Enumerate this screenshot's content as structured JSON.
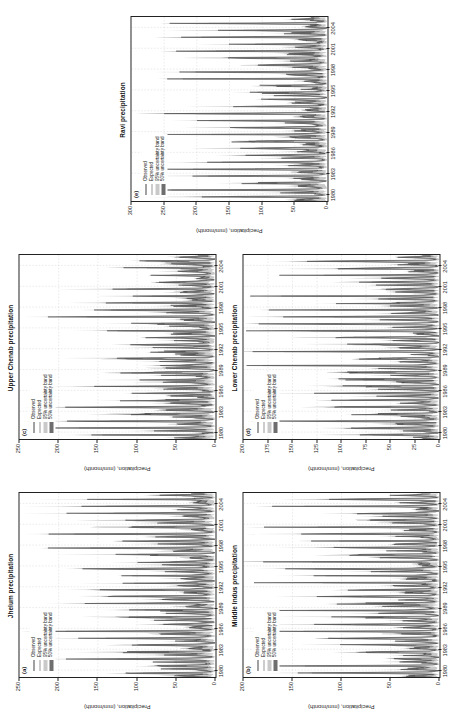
{
  "figure": {
    "axis_label": "Precipitation, (mm/month)",
    "legend": [
      {
        "key": "observed",
        "label": "Observed"
      },
      {
        "key": "expected",
        "label": "Expected"
      },
      {
        "key": "band95",
        "label": "95% uncertainty band"
      },
      {
        "key": "band50",
        "label": "50% uncertainty band"
      }
    ],
    "colors": {
      "observed": "#444444",
      "expected": "#9a9a9a",
      "band95": "#c9c9c9",
      "band50": "#6e6e6e",
      "axis": "#222222",
      "grid": "#cccccc"
    }
  },
  "chart_data": [
    {
      "type": "line",
      "tag": "(a)",
      "title": "Jhelum precipitation",
      "xlabel": "",
      "ylabel": "Precipitation, (mm/month)",
      "ylim": [
        0,
        250
      ],
      "yticks": [
        0,
        50,
        100,
        150,
        200,
        250
      ],
      "xlim": [
        1979,
        2005.5
      ],
      "xticks": [
        1980,
        1983,
        1986,
        1989,
        1992,
        1995,
        1998,
        2001,
        2004
      ],
      "grid": true,
      "legend_position": "top-left-inside",
      "series": [
        {
          "name": "Observed",
          "peak_max": 198,
          "mean": 48
        },
        {
          "name": "Expected",
          "peak_max": 172,
          "mean": 45
        }
      ],
      "seed": 11,
      "peak_scale": 0.8,
      "base_scale": 0.22
    },
    {
      "type": "line",
      "tag": "(b)",
      "title": "Middle Indus precipitation",
      "xlabel": "",
      "ylabel": "Precipitation, (mm/month)",
      "ylim": [
        0,
        200
      ],
      "yticks": [
        0,
        50,
        100,
        150,
        200
      ],
      "xlim": [
        1979,
        2005.5
      ],
      "xticks": [
        1980,
        1983,
        1986,
        1989,
        1992,
        1995,
        1998,
        2001,
        2004
      ],
      "grid": true,
      "legend_position": "top-left-inside",
      "series": [
        {
          "name": "Observed",
          "peak_max": 186,
          "mean": 36
        },
        {
          "name": "Expected",
          "peak_max": 160,
          "mean": 34
        }
      ],
      "seed": 23,
      "peak_scale": 0.88,
      "base_scale": 0.16
    },
    {
      "type": "line",
      "tag": "(c)",
      "title": "Upper Chenab precipitation",
      "xlabel": "",
      "ylabel": "Precipitation, (mm/month)",
      "ylim": [
        0,
        250
      ],
      "yticks": [
        0,
        50,
        100,
        150,
        200,
        250
      ],
      "xlim": [
        1979,
        2005.5
      ],
      "xticks": [
        1980,
        1983,
        1986,
        1989,
        1992,
        1995,
        1998,
        2001,
        2004
      ],
      "grid": true,
      "legend_position": "top-left-inside",
      "series": [
        {
          "name": "Observed",
          "peak_max": 205,
          "mean": 52
        },
        {
          "name": "Expected",
          "peak_max": 178,
          "mean": 49
        }
      ],
      "seed": 37,
      "peak_scale": 0.82,
      "base_scale": 0.24
    },
    {
      "type": "line",
      "tag": "(d)",
      "title": "Lower Chenab precipitation",
      "xlabel": "",
      "ylabel": "Precipitation, (mm/month)",
      "ylim": [
        0,
        200
      ],
      "yticks": [
        0,
        25,
        50,
        75,
        100,
        125,
        150,
        175,
        200
      ],
      "xlim": [
        1979,
        2005.5
      ],
      "xticks": [
        1980,
        1983,
        1986,
        1989,
        1992,
        1995,
        1998,
        2001,
        2004
      ],
      "grid": true,
      "legend_position": "top-left-inside",
      "series": [
        {
          "name": "Observed",
          "peak_max": 192,
          "mean": 30
        },
        {
          "name": "Expected",
          "peak_max": 150,
          "mean": 28
        }
      ],
      "seed": 53,
      "peak_scale": 0.92,
      "base_scale": 0.12
    },
    {
      "type": "line",
      "tag": "(e)",
      "title": "Ravi precipitation",
      "xlabel": "",
      "ylabel": "Precipitation, (mm/month)",
      "ylim": [
        0,
        300
      ],
      "yticks": [
        0,
        50,
        100,
        150,
        200,
        250,
        300
      ],
      "xlim": [
        1979,
        2005.5
      ],
      "xticks": [
        1980,
        1983,
        1986,
        1989,
        1992,
        1995,
        1998,
        2001,
        2004
      ],
      "grid": true,
      "legend_position": "top-left-inside",
      "series": [
        {
          "name": "Observed",
          "peak_max": 236,
          "mean": 44
        },
        {
          "name": "Expected",
          "peak_max": 198,
          "mean": 41
        }
      ],
      "seed": 71,
      "peak_scale": 0.76,
      "base_scale": 0.18
    }
  ]
}
